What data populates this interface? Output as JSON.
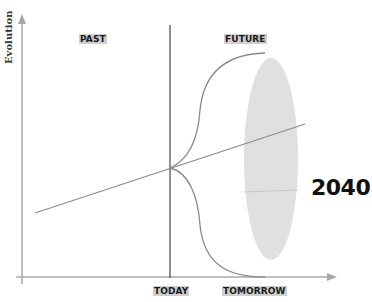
{
  "diagram": {
    "y_axis_label": "Evolution",
    "region_labels": {
      "past": "PAST",
      "future": "FUTURE"
    },
    "x_axis_labels": {
      "today": "TODAY",
      "tomorrow": "TOMORROW"
    },
    "horizon_label": "2040",
    "colors": {
      "axis": "#a8a8a8",
      "today_line": "#555555",
      "curves": "#8a8a8a",
      "trend_line": "#8c8c8c",
      "ellipse": "#e0e0e0",
      "label_highlight": "#cfcfcf",
      "text": "#111111"
    },
    "elements": {
      "trend_line": {
        "x1": 35,
        "y1": 213,
        "x2": 305,
        "y2": 124
      },
      "branch_point": {
        "x": 170,
        "y": 168
      },
      "upper_curve_end": {
        "x": 265,
        "y": 53
      },
      "lower_curve_end": {
        "x": 265,
        "y": 277
      },
      "ellipse": {
        "cx": 271,
        "cy": 159,
        "rx": 27,
        "ry": 101
      }
    }
  }
}
